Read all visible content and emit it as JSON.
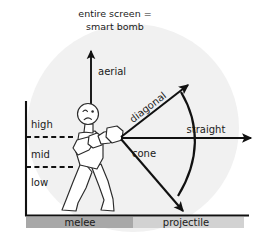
{
  "diagram": {
    "title_line1": "entire screen =",
    "title_line2": "smart bomb",
    "height_axis": {
      "name": "attack height axis",
      "levels": [
        {
          "label": "high"
        },
        {
          "label": "mid"
        },
        {
          "label": "low"
        }
      ]
    },
    "vectors": [
      {
        "label": "aerial",
        "direction": "up"
      },
      {
        "label": "diagonal",
        "direction": "up-right"
      },
      {
        "label": "straight",
        "direction": "right"
      },
      {
        "label": "cone",
        "direction": "arc-spread"
      }
    ],
    "ground_ranges": [
      {
        "label": "melee",
        "color": "#a8a8a8"
      },
      {
        "label": "projectile",
        "color": "#d2d2d2"
      }
    ],
    "character": {
      "name": "fighter",
      "pose": "guard stance",
      "expression": "frowning"
    },
    "colors": {
      "ink": "#111111",
      "text": "#1a1a1a",
      "backdrop": "#f1f1f1",
      "melee_bar": "#a8a8a8",
      "projectile_bar": "#d2d2d2",
      "figure_stroke": "#2b2b2b"
    }
  }
}
